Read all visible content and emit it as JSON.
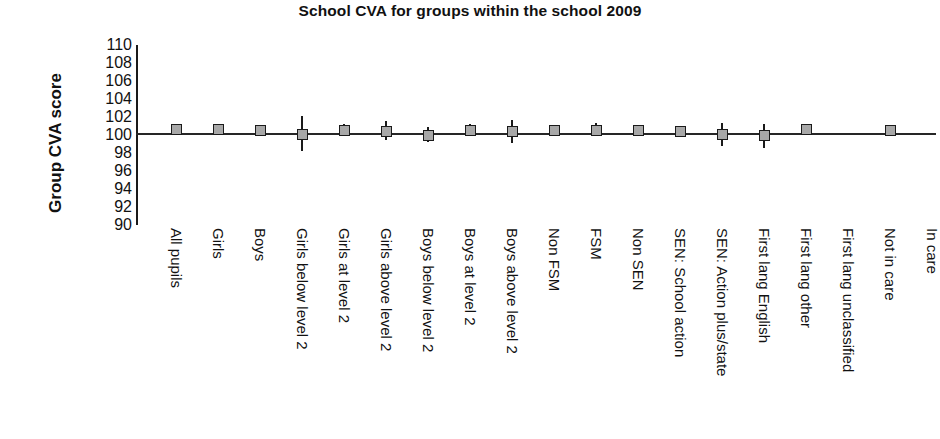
{
  "chart_data": {
    "type": "scatter",
    "title": "School CVA for groups within the school 2009",
    "xlabel": "",
    "ylabel": "Group CVA score",
    "ylim": [
      90,
      110
    ],
    "ytick_step": 2,
    "yticks": [
      110,
      108,
      106,
      104,
      102,
      100,
      98,
      96,
      94,
      92,
      90
    ],
    "grid": false,
    "legend": "none",
    "reference_line": 100,
    "categories": [
      "All pupils",
      "Girls",
      "Boys",
      "Girls below level 2",
      "Girls at level 2",
      "Girls above level 2",
      "Boys below level 2",
      "Boys at level 2",
      "Boys above level 2",
      "Non FSM",
      "FSM",
      "Non SEN",
      "SEN: School action",
      "SEN: Action plus/state",
      "First lang English",
      "First lang other",
      "First lang unclassified",
      "Not in care",
      "In care"
    ],
    "series": [
      {
        "name": "Group CVA score",
        "values": [
          100.6,
          100.6,
          100.5,
          100.1,
          100.5,
          100.4,
          100.0,
          100.5,
          100.4,
          100.5,
          100.5,
          100.5,
          100.4,
          100.1,
          100.0,
          100.6,
          null,
          100.5,
          null
        ],
        "ci_low": [
          100.2,
          100.1,
          99.9,
          98.2,
          99.9,
          99.4,
          99.2,
          99.9,
          99.1,
          100.0,
          99.9,
          100.1,
          99.9,
          98.8,
          98.5,
          100.1,
          null,
          99.9,
          null
        ],
        "ci_high": [
          101.0,
          101.2,
          101.1,
          102.1,
          101.2,
          101.6,
          100.9,
          101.2,
          101.7,
          101.1,
          101.3,
          101.0,
          101.0,
          101.3,
          101.2,
          101.2,
          null,
          101.1,
          null
        ]
      }
    ]
  }
}
